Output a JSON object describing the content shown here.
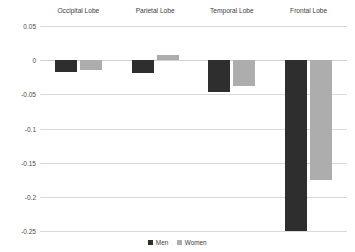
{
  "chart_data": {
    "type": "bar",
    "title": "",
    "subtitle": "",
    "xlabel": "",
    "ylabel": "",
    "categories": [
      "Occipital Lobe",
      "Parietal Lobe",
      "Temporal Lobe",
      "Frontal Lobe"
    ],
    "series": [
      {
        "name": "Men",
        "color": "#2e2e2e",
        "values": [
          -0.017,
          -0.019,
          -0.046,
          -0.25
        ]
      },
      {
        "name": "Women",
        "color": "#adadad",
        "values": [
          -0.015,
          0.007,
          -0.038,
          -0.175
        ]
      }
    ],
    "ylim": [
      -0.25,
      0.05
    ],
    "ytick_labels": [
      "0.05",
      "0",
      "-0.05",
      "-0.1",
      "-0.15",
      "-0.2",
      "-0.25"
    ],
    "ytick_values": [
      0.05,
      0,
      -0.05,
      -0.1,
      -0.15,
      -0.2,
      -0.25
    ],
    "grid": true,
    "legend_position": "bottom",
    "category_labels_position": "top"
  },
  "legend": {
    "items": [
      {
        "label": "Men"
      },
      {
        "label": "Women"
      }
    ]
  },
  "colors": {
    "men": "#2e2e2e",
    "women": "#adadad",
    "gridline": "#d9d9d9",
    "text": "#3d3d3d",
    "background": "#ffffff"
  }
}
